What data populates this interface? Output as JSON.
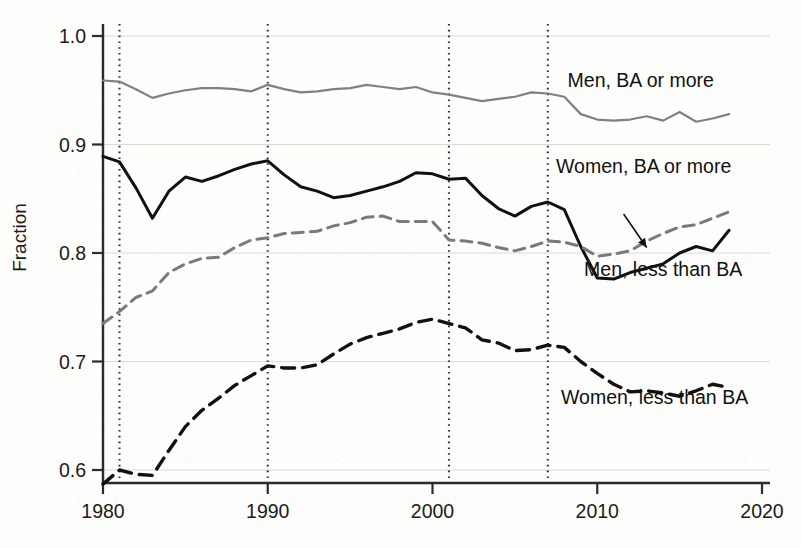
{
  "figure": {
    "background_color": "#fdfdfc",
    "axis_color": "#2b2b2b"
  },
  "axes": {
    "ylabel": "Fraction",
    "xlabel": "",
    "y_ticks": [
      "0.6",
      "0.7",
      "0.8",
      "0.9",
      "1.0"
    ],
    "y_tick_values": [
      0.6,
      0.7,
      0.8,
      0.9,
      1.0
    ],
    "x_ticks": [
      "1980",
      "1990",
      "2000",
      "2010",
      "2020"
    ],
    "x_tick_values": [
      1980,
      1990,
      2000,
      2010,
      2020
    ],
    "xlim": [
      1980,
      2020
    ],
    "ylim": [
      0.565,
      1.01
    ],
    "grid": "horizontal-faint"
  },
  "annotations": {
    "recession_lines": [
      1980,
      1981,
      1990,
      2001,
      2007
    ],
    "recession_line_color": "#333333",
    "arrow": {
      "name": "women-ba-pointer",
      "from_year": 2011.6,
      "from_value": 0.836,
      "to_year": 2013.0,
      "to_value": 0.805
    }
  },
  "series_labels": [
    {
      "text": "Men, BA or more",
      "year": 2008.2,
      "value": 0.953
    },
    {
      "text": "Women, BA or more",
      "year": 2007.5,
      "value": 0.874
    },
    {
      "text": "Men, less than BA",
      "year": 2009.2,
      "value": 0.779
    },
    {
      "text": "Women, less than BA",
      "year": 2007.8,
      "value": 0.661
    }
  ],
  "chart_data": {
    "type": "line",
    "title": "",
    "xlabel": "",
    "ylabel": "Fraction",
    "xlim": [
      1980,
      2020
    ],
    "ylim": [
      0.565,
      1.01
    ],
    "grid": true,
    "legend": "inline-labels",
    "x": [
      1980,
      1981,
      1982,
      1983,
      1984,
      1985,
      1986,
      1987,
      1988,
      1989,
      1990,
      1991,
      1992,
      1993,
      1994,
      1995,
      1996,
      1997,
      1998,
      1999,
      2000,
      2001,
      2002,
      2003,
      2004,
      2005,
      2006,
      2007,
      2008,
      2009,
      2010,
      2011,
      2012,
      2013,
      2014,
      2015,
      2016,
      2017,
      2018
    ],
    "series": [
      {
        "name": "Men, BA or more",
        "style": "solid",
        "color": "#808080",
        "width": 2.2,
        "values": [
          0.959,
          0.958,
          0.951,
          0.943,
          0.947,
          0.95,
          0.952,
          0.952,
          0.951,
          0.949,
          0.955,
          0.951,
          0.948,
          0.949,
          0.951,
          0.952,
          0.955,
          0.953,
          0.951,
          0.953,
          0.948,
          0.946,
          0.943,
          0.94,
          0.942,
          0.944,
          0.948,
          0.947,
          0.944,
          0.928,
          0.923,
          0.922,
          0.923,
          0.926,
          0.922,
          0.93,
          0.921,
          0.924,
          0.928
        ]
      },
      {
        "name": "Men, less than BA",
        "style": "solid",
        "color": "#111111",
        "width": 3.0,
        "values": [
          0.889,
          0.884,
          0.86,
          0.832,
          0.857,
          0.87,
          0.866,
          0.871,
          0.877,
          0.882,
          0.885,
          0.872,
          0.861,
          0.857,
          0.851,
          0.853,
          0.857,
          0.861,
          0.866,
          0.874,
          0.873,
          0.868,
          0.869,
          0.853,
          0.841,
          0.834,
          0.843,
          0.847,
          0.84,
          0.806,
          0.777,
          0.776,
          0.782,
          0.786,
          0.79,
          0.8,
          0.806,
          0.802,
          0.821
        ]
      },
      {
        "name": "Women, BA or more",
        "style": "dashed",
        "color": "#7a7a7a",
        "width": 3.0,
        "values": [
          0.735,
          0.746,
          0.759,
          0.765,
          0.782,
          0.79,
          0.795,
          0.796,
          0.805,
          0.812,
          0.814,
          0.818,
          0.819,
          0.82,
          0.825,
          0.828,
          0.833,
          0.834,
          0.829,
          0.829,
          0.829,
          0.812,
          0.811,
          0.809,
          0.805,
          0.802,
          0.806,
          0.811,
          0.81,
          0.806,
          0.797,
          0.799,
          0.802,
          0.811,
          0.818,
          0.824,
          0.826,
          0.832,
          0.838
        ]
      },
      {
        "name": "Women, less than BA",
        "style": "dashed",
        "color": "#111111",
        "width": 3.4,
        "values": [
          0.587,
          0.6,
          0.596,
          0.595,
          0.618,
          0.64,
          0.655,
          0.666,
          0.678,
          0.687,
          0.696,
          0.694,
          0.694,
          0.697,
          0.707,
          0.716,
          0.722,
          0.726,
          0.73,
          0.736,
          0.739,
          0.735,
          0.731,
          0.72,
          0.717,
          0.71,
          0.711,
          0.715,
          0.713,
          0.7,
          0.689,
          0.679,
          0.672,
          0.673,
          0.671,
          0.668,
          0.673,
          0.679,
          0.676
        ]
      }
    ]
  }
}
